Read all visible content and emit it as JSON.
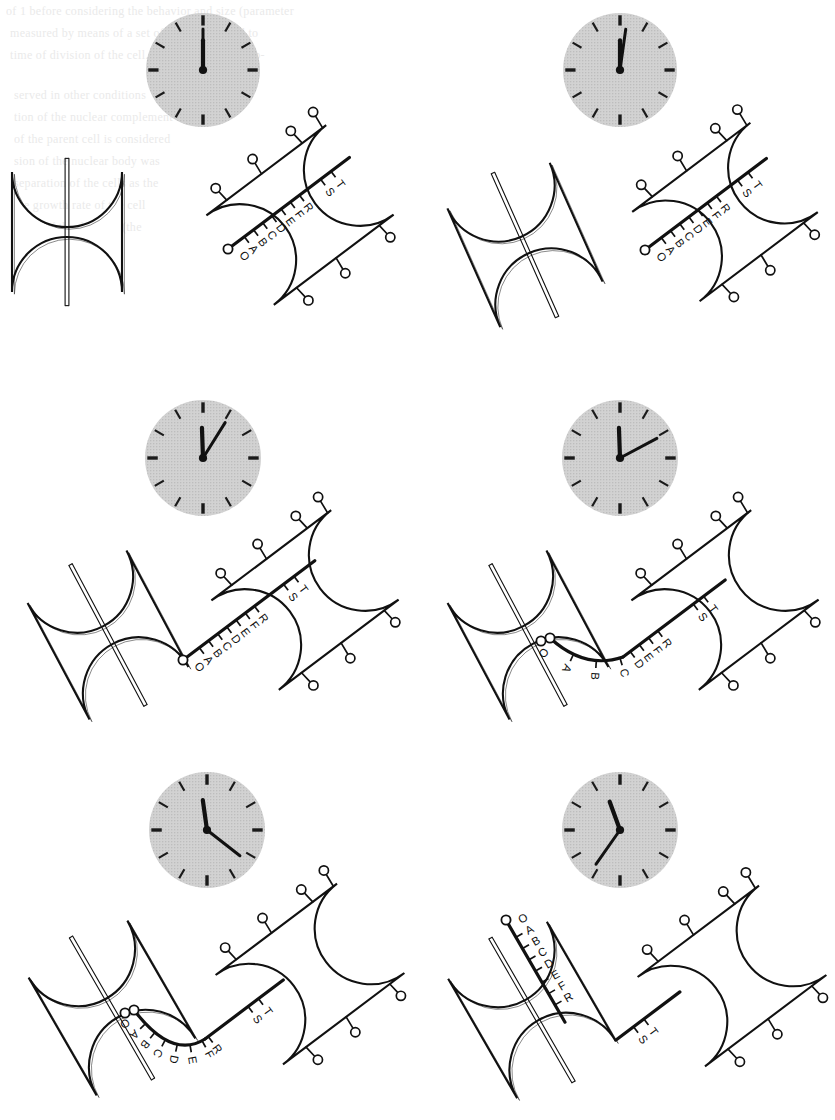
{
  "figure": {
    "type": "scientific-diagram",
    "panel_count": 6,
    "layout": {
      "rows": 3,
      "cols": 2
    },
    "canvas": {
      "width": 835,
      "height": 1120,
      "background": "#ffffff"
    },
    "colors": {
      "ink": "#111111",
      "cell_fill": "#ffffff",
      "clock_fill": "#cfcfcf",
      "clock_tick": "#1a1a1a",
      "bleed_text": "#d9d9d9"
    },
    "legend_keys": {
      "capsule": "rod-shaped (capsule) bacterial cell outline",
      "pin_marker": "circle-headed pin = surface marker / attachment site",
      "track": "thick line with tick marks = chromosome / wall band with loci",
      "slit": "narrow double line inside cell = unreplicated strand",
      "clock": "shaded clock face indicating elapsed time for the panel"
    }
  },
  "track_labels": [
    "O",
    "A",
    "B",
    "C",
    "D",
    "E",
    "F",
    "R",
    "S",
    "T"
  ],
  "origin_label": "O",
  "panels": [
    {
      "id": "panel-1",
      "index": 1,
      "position": "top-left",
      "clock": {
        "hour_deg": 270,
        "minute_deg": 0,
        "reading": "9:00"
      },
      "left_cell": {
        "state": "unlabeled",
        "has_slit": true,
        "has_track": false,
        "orientation": "vertical"
      },
      "right_cell": {
        "state": "labeled",
        "has_track": true,
        "pin_count": 7
      },
      "track_labels_left": [],
      "track_labels_right": [
        "O",
        "A",
        "B",
        "C",
        "D",
        "E",
        "F",
        "R",
        "S",
        "T"
      ]
    },
    {
      "id": "panel-2",
      "index": 2,
      "position": "top-right",
      "clock": {
        "hour_deg": 270,
        "minute_deg": 8,
        "reading": "9:01"
      },
      "left_cell": {
        "state": "unlabeled",
        "has_slit": true,
        "has_track": false,
        "orientation": "tilted"
      },
      "right_cell": {
        "state": "labeled",
        "has_track": true,
        "pin_count": 7
      },
      "track_labels_left": [],
      "track_labels_right": [
        "O",
        "A",
        "B",
        "C",
        "D",
        "E",
        "F",
        "R",
        "S",
        "T"
      ]
    },
    {
      "id": "panel-3",
      "index": 3,
      "position": "middle-left",
      "clock": {
        "hour_deg": 268,
        "minute_deg": 32,
        "reading": "9:05"
      },
      "left_cell": {
        "state": "unlabeled",
        "has_slit": true,
        "has_track": false,
        "orientation": "tilted"
      },
      "right_cell": {
        "state": "labeled",
        "has_track": true,
        "pin_count": 7
      },
      "track_labels_left": [],
      "track_labels_right": [
        "O",
        "A",
        "B",
        "C",
        "D",
        "E",
        "F",
        "R",
        "S",
        "T"
      ]
    },
    {
      "id": "panel-4",
      "index": 4,
      "position": "middle-right",
      "clock": {
        "hour_deg": 268,
        "minute_deg": 62,
        "reading": "9:10"
      },
      "left_cell": {
        "state": "unlabeled",
        "has_slit": true,
        "has_track": false,
        "orientation": "tilted"
      },
      "right_cell": {
        "state": "labeled",
        "has_track": true,
        "pin_count": 7
      },
      "track_labels_left": [
        "O",
        "A",
        "B",
        "C"
      ],
      "track_labels_right": [
        "D",
        "E",
        "F",
        "R",
        "S",
        "T"
      ]
    },
    {
      "id": "panel-5",
      "index": 5,
      "position": "bottom-left",
      "clock": {
        "hour_deg": 262,
        "minute_deg": 128,
        "reading": "9:21"
      },
      "left_cell": {
        "state": "partly-labeled",
        "has_slit": true,
        "has_track": true,
        "orientation": "tilted"
      },
      "right_cell": {
        "state": "labeled",
        "has_track": true,
        "pin_count": 7
      },
      "track_labels_left": [
        "O",
        "A",
        "B",
        "C",
        "D",
        "E",
        "F"
      ],
      "track_labels_right": [
        "R",
        "S",
        "T"
      ]
    },
    {
      "id": "panel-6",
      "index": 6,
      "position": "bottom-right",
      "clock": {
        "hour_deg": 250,
        "minute_deg": 215,
        "reading": "9:36"
      },
      "left_cell": {
        "state": "labeled",
        "has_slit": true,
        "has_track": true,
        "orientation": "tilted"
      },
      "right_cell": {
        "state": "labeled",
        "has_track": true,
        "pin_count": 7
      },
      "track_labels_left": [
        "O",
        "A",
        "B",
        "C",
        "D",
        "E",
        "F",
        "R"
      ],
      "track_labels_right": [
        "S",
        "T"
      ]
    }
  ],
  "background_bleed_text": [
    {
      "text": "of 1 before considering the behavior and size (parameter",
      "x": 6,
      "y": 4,
      "size": 12
    },
    {
      "text": "measured by means of a set of points assumed to",
      "x": 10,
      "y": 26,
      "size": 12
    },
    {
      "text": "time of division of the cell. Since the cells are ob-",
      "x": 10,
      "y": 48,
      "size": 12
    },
    {
      "text": "served in other conditions",
      "x": 14,
      "y": 88,
      "size": 12
    },
    {
      "text": "tion of the nuclear complement",
      "x": 14,
      "y": 110,
      "size": 12
    },
    {
      "text": "of the parent cell is considered",
      "x": 14,
      "y": 132,
      "size": 12
    },
    {
      "text": "sion of the nuclear body was",
      "x": 14,
      "y": 154,
      "size": 12
    },
    {
      "text": "separation of the cells as the",
      "x": 14,
      "y": 176,
      "size": 12
    },
    {
      "text": "the growth rate of the cell",
      "x": 14,
      "y": 198,
      "size": 12
    },
    {
      "text": "value of the division (the",
      "x": 14,
      "y": 220,
      "size": 12
    }
  ]
}
